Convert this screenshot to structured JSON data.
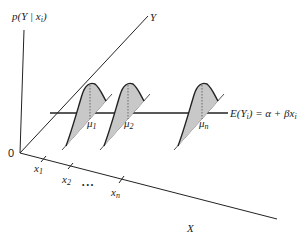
{
  "diagram": {
    "type": "regression-conditional-distributions",
    "axes": {
      "vertical_label": "p(Y | x",
      "vertical_label_sub": "i",
      "vertical_label_close": ")",
      "y_axis_label": "Y",
      "x_axis_label": "X",
      "origin_label": "0"
    },
    "x_ticks": [
      {
        "label": "x",
        "sub": "1"
      },
      {
        "label": "x",
        "sub": "2"
      },
      {
        "label": "x",
        "sub": "n"
      }
    ],
    "ellipsis": "• • •",
    "means": [
      {
        "label": "μ",
        "sub": "1"
      },
      {
        "label": "μ",
        "sub": "2"
      },
      {
        "label": "μ",
        "sub": "n"
      }
    ],
    "regression_line": {
      "label_prefix": "E(Y",
      "label_sub": "i",
      "label_suffix": ") = α + βx",
      "label_suffix_sub": "i"
    },
    "colors": {
      "line": "#222222",
      "fill": "#c8c8c8",
      "background": "#ffffff"
    }
  }
}
